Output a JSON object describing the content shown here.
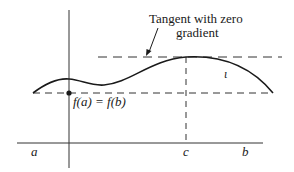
{
  "figure": {
    "annotation": {
      "line1": "Tangent with zero",
      "line2": "gradient"
    },
    "point_label": "f(a) = f(b)",
    "axis_labels": {
      "a": "a",
      "c": "c",
      "b": "b"
    },
    "curve_label": "ι",
    "colors": {
      "ink": "#1a1a1a",
      "background": "#ffffff"
    }
  }
}
